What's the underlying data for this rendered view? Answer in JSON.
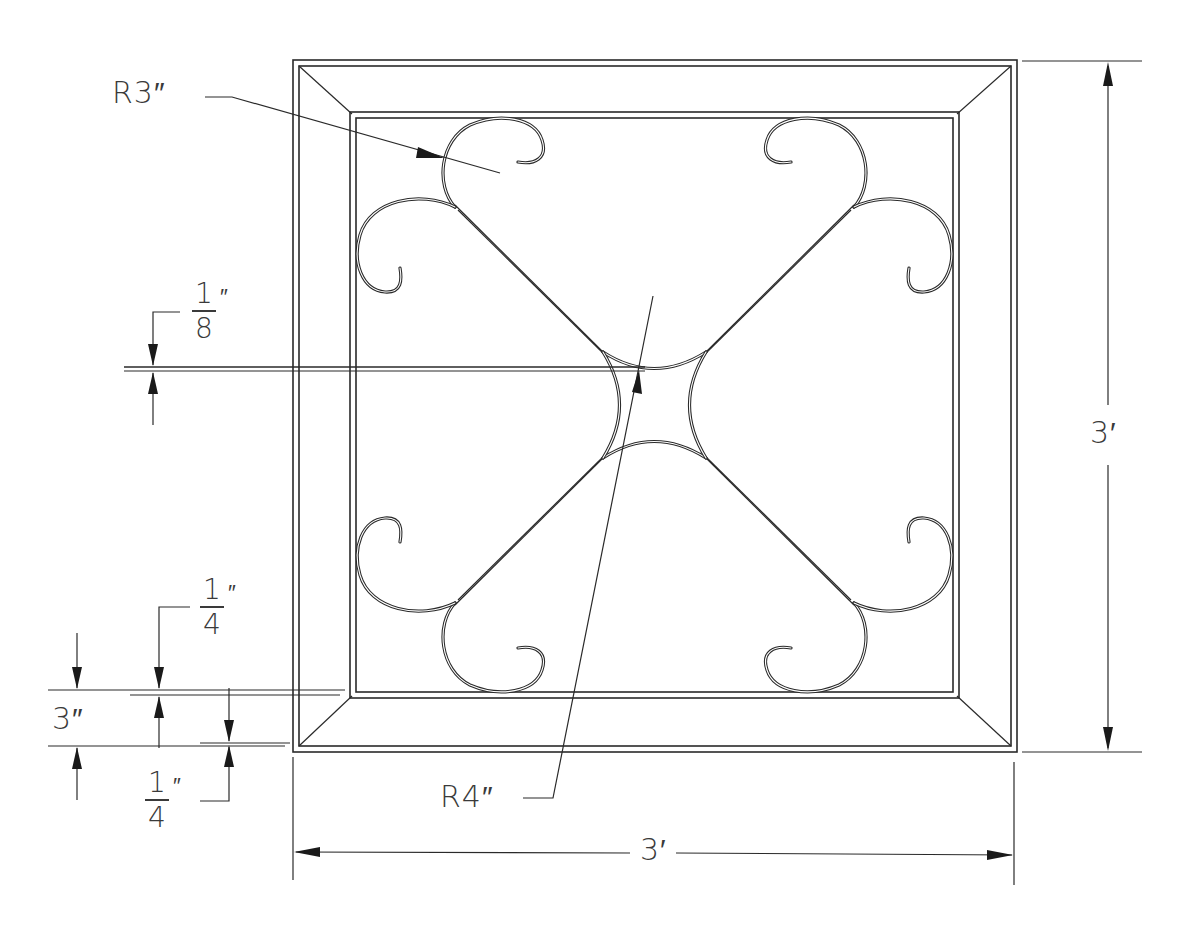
{
  "drawing": {
    "title": "Square frame with scroll grille",
    "colors": {
      "line": "#2a2a2a",
      "text": "#3a3a3a",
      "background": "#ffffff"
    },
    "labels": {
      "radius_outer_scroll": "R3″",
      "radius_center": "R4″",
      "height_overall": "3′",
      "width_overall": "3′",
      "frame_width": "3″",
      "gap_center": {
        "numerator": "1",
        "denominator": "8",
        "unit": "″"
      },
      "inset_top": {
        "numerator": "1",
        "denominator": "4",
        "unit": "″"
      },
      "inset_bottom": {
        "numerator": "1",
        "denominator": "4",
        "unit": "″"
      }
    },
    "dimensions": [
      {
        "name": "overall-height",
        "value": "3'",
        "orientation": "vertical"
      },
      {
        "name": "overall-width",
        "value": "3'",
        "orientation": "horizontal"
      },
      {
        "name": "frame-width",
        "value": "3\"",
        "orientation": "vertical"
      },
      {
        "name": "top-inset",
        "value": "1/4\"",
        "orientation": "vertical"
      },
      {
        "name": "bottom-inset",
        "value": "1/4\"",
        "orientation": "vertical"
      },
      {
        "name": "center-gap",
        "value": "1/8\"",
        "orientation": "vertical"
      },
      {
        "name": "scroll-radius",
        "value": "R3\"",
        "type": "radius"
      },
      {
        "name": "center-radius",
        "value": "R4\"",
        "type": "radius"
      }
    ]
  }
}
